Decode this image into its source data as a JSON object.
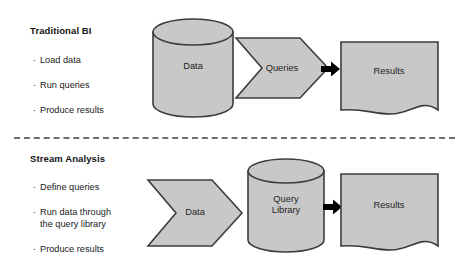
{
  "diagram": {
    "background_color": "#ffffff",
    "shape_fill": "#c8c8c8",
    "shape_stroke": "#3c3c3c",
    "arrow_color": "#000000",
    "divider_color": "#6f6f6f"
  },
  "sections": [
    {
      "id": "traditional-bi",
      "heading": "Traditional BI",
      "bullets": [
        {
          "text": "Load data",
          "line2": ""
        },
        {
          "text": "Run queries",
          "line2": ""
        },
        {
          "text": "Produce results",
          "line2": ""
        }
      ],
      "flow": [
        {
          "id": "data-cylinder",
          "shape": "cylinder",
          "label": "Data",
          "label_line2": ""
        },
        {
          "id": "queries-chevron",
          "shape": "chevron",
          "label": "Queries",
          "label_line2": ""
        },
        {
          "id": "arrow-1",
          "shape": "arrow",
          "label": "",
          "label_line2": ""
        },
        {
          "id": "results-document",
          "shape": "document",
          "label": "Results",
          "label_line2": ""
        }
      ]
    },
    {
      "id": "stream-analysis",
      "heading": "Stream Analysis",
      "bullets": [
        {
          "text": "Define queries",
          "line2": ""
        },
        {
          "text": "Run data through",
          "line2": "the query library"
        },
        {
          "text": "Produce results",
          "line2": ""
        }
      ],
      "flow": [
        {
          "id": "data-chevron",
          "shape": "chevron",
          "label": "Data",
          "label_line2": ""
        },
        {
          "id": "query-library-cylinder",
          "shape": "cylinder",
          "label": "Query",
          "label_line2": "Library"
        },
        {
          "id": "arrow-2",
          "shape": "arrow",
          "label": "",
          "label_line2": ""
        },
        {
          "id": "results-document-2",
          "shape": "document",
          "label": "Results",
          "label_line2": ""
        }
      ]
    }
  ],
  "bullet_glyph": "·"
}
